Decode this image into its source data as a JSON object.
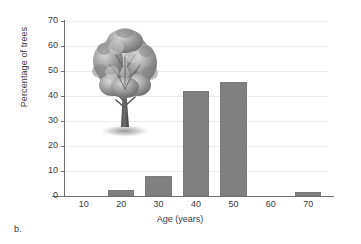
{
  "figure": {
    "caption_label": "b.",
    "overlay_icon": "tree-illustration"
  },
  "chart_data": {
    "type": "bar",
    "title": "",
    "xlabel": "Age (years)",
    "ylabel": "Percentage of trees",
    "categories": [
      "10",
      "20",
      "30",
      "40",
      "50",
      "60",
      "70"
    ],
    "values": [
      0,
      2.5,
      8,
      42,
      45.5,
      0,
      1.5
    ],
    "series": [
      {
        "name": "Percentage of trees",
        "values": [
          0,
          2.5,
          8,
          42,
          45.5,
          0,
          1.5
        ]
      }
    ],
    "ylim": [
      0,
      70
    ],
    "ytick_labels": [
      "0",
      "10",
      "20",
      "30",
      "40",
      "50",
      "60",
      "70"
    ],
    "ytick_values": [
      0,
      10,
      20,
      30,
      40,
      50,
      60,
      70
    ],
    "xtick_labels": [
      "10",
      "20",
      "30",
      "40",
      "50",
      "60",
      "70"
    ],
    "grid": true,
    "legend": "none",
    "bar_color": "#808080",
    "grid_color": "#ececed",
    "axis_color": "#6e6e6e"
  }
}
